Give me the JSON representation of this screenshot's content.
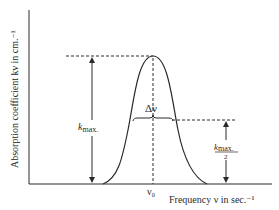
{
  "diagram": {
    "type": "absorption-line-profile",
    "y_axis_label": "Absorption coefficient kν in cm.⁻¹",
    "x_axis_label": "Frequency ν in sec.⁻¹",
    "center_label": "ν₀",
    "width_label": "Δν",
    "peak_label": "k",
    "peak_subscript": "max.",
    "half_label_top": "k",
    "half_label_sub": "max.",
    "half_label_denominator": "2",
    "colors": {
      "line": "#2a2a2a",
      "background": "#ffffff"
    }
  }
}
